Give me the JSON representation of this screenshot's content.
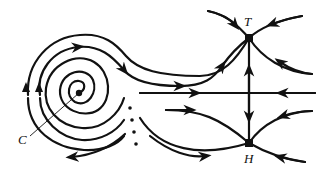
{
  "diagram": {
    "type": "phase-portrait",
    "labels": {
      "center": "C",
      "top_saddle": "T",
      "bottom_saddle": "H"
    },
    "nodes": [
      {
        "id": "C",
        "kind": "spiral-center",
        "x": 79,
        "y": 93
      },
      {
        "id": "T",
        "kind": "saddle",
        "x": 249,
        "y": 38
      },
      {
        "id": "H",
        "kind": "saddle",
        "x": 249,
        "y": 143
      }
    ],
    "colors": {
      "stroke": "#111111",
      "background": "#ffffff"
    }
  }
}
